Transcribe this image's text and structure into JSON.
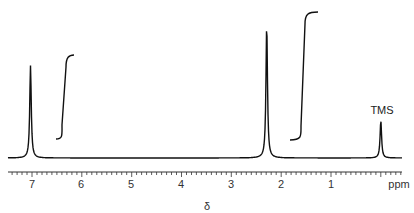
{
  "chart_data": {
    "type": "line",
    "title": "",
    "subtitle": "1H NMR spectrum",
    "xlabel": "δ",
    "x_unit_label": "ppm",
    "ylabel": "",
    "xlim": [
      7.6,
      -0.4
    ],
    "x_reversed": true,
    "x_ticks": [
      7,
      6,
      5,
      4,
      3,
      2,
      1
    ],
    "minor_tick_step": 0.1,
    "grid": false,
    "legend": null,
    "peaks": [
      {
        "shift_ppm": 7.03,
        "relative_height": 0.69,
        "label": ""
      },
      {
        "shift_ppm": 2.29,
        "relative_height": 1.0,
        "label": ""
      },
      {
        "shift_ppm": 0.0,
        "relative_height": 0.28,
        "label": "TMS"
      }
    ],
    "integrals": [
      {
        "region_ppm": [
          7.2,
          6.8
        ],
        "relative_step": 0.4
      },
      {
        "region_ppm": [
          2.5,
          2.1
        ],
        "relative_step": 0.6
      }
    ],
    "annotations": [
      "TMS"
    ]
  },
  "labels": {
    "tick_7": "7",
    "tick_6": "6",
    "tick_5": "5",
    "tick_4": "4",
    "tick_3": "3",
    "tick_2": "2",
    "tick_1": "1",
    "unit": "ppm",
    "xlabel": "δ",
    "tms": "TMS"
  },
  "colors": {
    "line": "#111111",
    "axis": "#333333"
  }
}
